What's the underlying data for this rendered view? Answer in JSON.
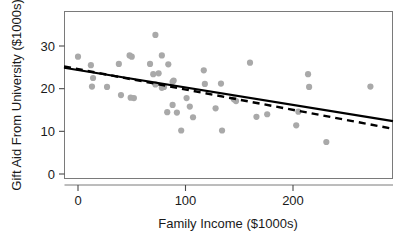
{
  "chart_data": {
    "type": "scatter",
    "title": "",
    "xlabel": "Family Income ($1000s)",
    "ylabel": "Gift Aid From University ($1000s)",
    "xlim": [
      -13,
      293
    ],
    "ylim": [
      -1.2,
      31.5
    ],
    "xticks": [
      0,
      100,
      200
    ],
    "xtick_labels": [
      "0",
      "100",
      "200"
    ],
    "yticks": [
      0,
      10,
      20,
      30
    ],
    "ytick_labels": [
      "0",
      "10",
      "20",
      "30"
    ],
    "grid": false,
    "legend": null,
    "marker": {
      "shape": "circle",
      "color": "#a9a9a9",
      "size": 5
    },
    "points": [
      {
        "x": 0,
        "y": 27.5
      },
      {
        "x": 12,
        "y": 25.5
      },
      {
        "x": 14,
        "y": 22.5
      },
      {
        "x": 13,
        "y": 20.5
      },
      {
        "x": 27,
        "y": 20.4
      },
      {
        "x": 38,
        "y": 25.8
      },
      {
        "x": 40,
        "y": 18.5
      },
      {
        "x": 48,
        "y": 27.8
      },
      {
        "x": 50,
        "y": 27.5
      },
      {
        "x": 49,
        "y": 17.9
      },
      {
        "x": 52,
        "y": 17.8
      },
      {
        "x": 67,
        "y": 25.8
      },
      {
        "x": 70,
        "y": 23.4
      },
      {
        "x": 72,
        "y": 32.6
      },
      {
        "x": 72,
        "y": 21.0
      },
      {
        "x": 75,
        "y": 23.6
      },
      {
        "x": 78,
        "y": 27.8
      },
      {
        "x": 78,
        "y": 20.2
      },
      {
        "x": 80,
        "y": 20.4
      },
      {
        "x": 84,
        "y": 25.7
      },
      {
        "x": 83,
        "y": 14.5
      },
      {
        "x": 88,
        "y": 21.6
      },
      {
        "x": 89,
        "y": 21.9
      },
      {
        "x": 88,
        "y": 16.2
      },
      {
        "x": 92,
        "y": 14.4
      },
      {
        "x": 96,
        "y": 10.2
      },
      {
        "x": 101,
        "y": 17.8
      },
      {
        "x": 104,
        "y": 15.8
      },
      {
        "x": 107,
        "y": 13.3
      },
      {
        "x": 117,
        "y": 24.3
      },
      {
        "x": 118,
        "y": 21.1
      },
      {
        "x": 128,
        "y": 15.4
      },
      {
        "x": 133,
        "y": 21.2
      },
      {
        "x": 134,
        "y": 10.2
      },
      {
        "x": 145,
        "y": 17.5
      },
      {
        "x": 147,
        "y": 17.1
      },
      {
        "x": 160,
        "y": 26.1
      },
      {
        "x": 166,
        "y": 13.4
      },
      {
        "x": 176,
        "y": 14.0
      },
      {
        "x": 203,
        "y": 11.4
      },
      {
        "x": 205,
        "y": 14.6
      },
      {
        "x": 214,
        "y": 23.4
      },
      {
        "x": 215,
        "y": 20.4
      },
      {
        "x": 231,
        "y": 7.5
      },
      {
        "x": 272,
        "y": 20.5
      }
    ],
    "lines": [
      {
        "name": "least-squares-fit-solid",
        "style": "solid",
        "color": "#000000",
        "x0": -13,
        "y0": 24.9,
        "x1": 293,
        "y1": 12.4
      },
      {
        "name": "robust-fit-dashed",
        "style": "dashed",
        "color": "#000000",
        "x0": -13,
        "y0": 25.2,
        "x1": 293,
        "y1": 10.6
      }
    ]
  }
}
